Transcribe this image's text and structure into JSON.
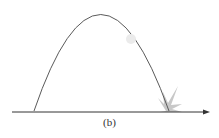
{
  "figure": {
    "caption": "(b)",
    "colors": {
      "trajectory": "#555555",
      "axis": "#333333",
      "ball": "#e6e6e6",
      "splash": "#bdbdbd"
    }
  }
}
